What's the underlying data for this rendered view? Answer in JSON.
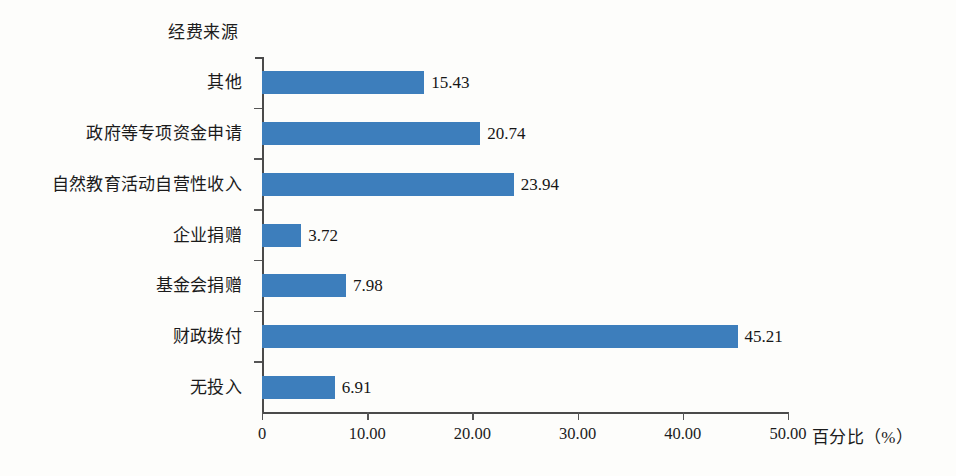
{
  "chart_data": {
    "type": "bar",
    "orientation": "horizontal",
    "title": "",
    "ylabel": "经费来源",
    "xlabel": "百分比（%）",
    "categories": [
      "其他",
      "政府等专项资金申请",
      "自然教育活动自营性收入",
      "企业捐赠",
      "基金会捐赠",
      "财政拨付",
      "无投入"
    ],
    "values": [
      15.43,
      20.74,
      23.94,
      3.72,
      7.98,
      45.21,
      6.91
    ],
    "value_labels": [
      "15.43",
      "20.74",
      "23.94",
      "3.72",
      "7.98",
      "45.21",
      "6.91"
    ],
    "xlim": [
      0,
      50
    ],
    "xticks": [
      0,
      10,
      20,
      30,
      40,
      50
    ],
    "xtick_labels": [
      "0",
      "10.00",
      "20.00",
      "30.00",
      "40.00",
      "50.00"
    ],
    "grid": false,
    "legend": false,
    "bar_color": "#3d7ebc",
    "axis_color": "#4a4a4a",
    "text_color": "#1b1b1b",
    "background": "#fdfdfb"
  }
}
